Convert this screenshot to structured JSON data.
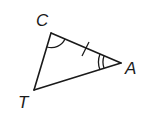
{
  "diagram": {
    "type": "triangle",
    "name": "Triangle CAT",
    "vertices": [
      {
        "label": "C",
        "x": 51,
        "y": 33
      },
      {
        "label": "A",
        "x": 121,
        "y": 63
      },
      {
        "label": "T",
        "x": 34,
        "y": 90
      }
    ],
    "sides": [
      "CA",
      "AT",
      "TC"
    ],
    "markings": {
      "angle_C": "single arc",
      "angle_A": "double arc",
      "side_CA": "single tick mark"
    }
  },
  "labels": {
    "c": "C",
    "a": "A",
    "t": "T"
  }
}
